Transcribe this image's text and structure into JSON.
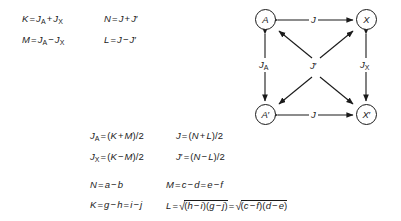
{
  "figure": {
    "background": "#ffffff",
    "ink": "#1a1a1a"
  },
  "equations_top": {
    "rows": [
      {
        "left": "K = JA + JX",
        "right": "N = J + J′"
      },
      {
        "left": "M = JA − JX",
        "right": "L = J − J′"
      }
    ],
    "r1c1": {
      "lhs": "K",
      "rhs_a": "J",
      "rhs_a_sub": "A",
      "op": "+",
      "rhs_b": "J",
      "rhs_b_sub": "X"
    },
    "r1c2": {
      "lhs": "N",
      "rhs_a": "J",
      "op": "+",
      "rhs_b": "J",
      "prime": "′"
    },
    "r2c1": {
      "lhs": "M",
      "rhs_a": "J",
      "rhs_a_sub": "A",
      "op": "−",
      "rhs_b": "J",
      "rhs_b_sub": "X"
    },
    "r2c2": {
      "lhs": "L",
      "rhs_a": "J",
      "op": "−",
      "rhs_b": "J",
      "prime": "′"
    }
  },
  "equations_middle": {
    "r1c1": {
      "lhs": "J",
      "lhs_sub": "A",
      "num_a": "K",
      "op": "+",
      "num_b": "M",
      "den": "2"
    },
    "r1c2": {
      "lhs": "J",
      "num_a": "N",
      "op": "+",
      "num_b": "L",
      "den": "2"
    },
    "r2c1": {
      "lhs": "J",
      "lhs_sub": "X",
      "num_a": "K",
      "op": "−",
      "num_b": "M",
      "den": "2"
    },
    "r2c2": {
      "lhs": "J",
      "prime": "′",
      "num_a": "N",
      "op": "−",
      "num_b": "L",
      "den": "2"
    },
    "plain": [
      "JA = (K + M)/2",
      "J = (N + L)/2",
      "JX = (K − M)/2",
      "J′ = (N − L)/2"
    ]
  },
  "equations_bottom": {
    "n": {
      "lhs": "N",
      "rhs": "a − b",
      "a": "a",
      "op": "−",
      "b": "b"
    },
    "m": {
      "lhs": "M",
      "a": "c",
      "op1": "−",
      "b": "d",
      "c": "e",
      "op2": "−",
      "d": "f",
      "plain": "M = c − d = e − f"
    },
    "k": {
      "lhs": "K",
      "a": "g",
      "op1": "−",
      "b": "h",
      "c": "i",
      "op2": "−",
      "d": "j",
      "plain": "K = g − h = i − j"
    },
    "l": {
      "lhs": "L",
      "radical": "√",
      "term1": "(h − i)(g − j)",
      "t1_a": "h",
      "t1_op": "−",
      "t1_b": "i",
      "t1_c": "g",
      "t1_op2": "−",
      "t1_d": "j",
      "term2": "(c − f)(d − e)",
      "t2_a": "c",
      "t2_op": "−",
      "t2_b": "f",
      "t2_c": "d",
      "t2_op2": "−",
      "t2_d": "e",
      "plain": "L = √((h−i)(g−j)) = √((c−f)(d−e))"
    }
  },
  "diagram": {
    "nodes": [
      {
        "id": "A",
        "label": "A",
        "base": "A",
        "prime": ""
      },
      {
        "id": "X",
        "label": "X",
        "base": "X",
        "prime": ""
      },
      {
        "id": "Ap",
        "label": "A′",
        "base": "A",
        "prime": "′"
      },
      {
        "id": "Xp",
        "label": "X′",
        "base": "X",
        "prime": "′"
      }
    ],
    "edges": [
      {
        "from": "A",
        "to": "X",
        "label": "J",
        "sub": "",
        "prime": "",
        "kind": "top-horizontal"
      },
      {
        "from": "Ap",
        "to": "Xp",
        "label": "J",
        "sub": "",
        "prime": "",
        "kind": "bottom-horizontal"
      },
      {
        "from": "A",
        "to": "Ap",
        "label": "J",
        "sub": "A",
        "prime": "",
        "kind": "left-vertical"
      },
      {
        "from": "X",
        "to": "Xp",
        "label": "J",
        "sub": "X",
        "prime": "",
        "kind": "right-vertical"
      },
      {
        "from": "center",
        "to": "A",
        "label": "J",
        "sub": "",
        "prime": "′",
        "kind": "diagonal"
      },
      {
        "from": "center",
        "to": "X",
        "label": "J",
        "sub": "",
        "prime": "′",
        "kind": "diagonal"
      },
      {
        "from": "center",
        "to": "Ap",
        "label": "J",
        "sub": "",
        "prime": "′",
        "kind": "diagonal"
      },
      {
        "from": "center",
        "to": "Xp",
        "label": "J",
        "sub": "",
        "prime": "′",
        "kind": "diagonal"
      }
    ],
    "labels": {
      "top": "J",
      "bottom": "J",
      "left": "J",
      "left_sub": "A",
      "right": "J",
      "right_sub": "X",
      "center": "J",
      "center_prime": "′"
    }
  }
}
